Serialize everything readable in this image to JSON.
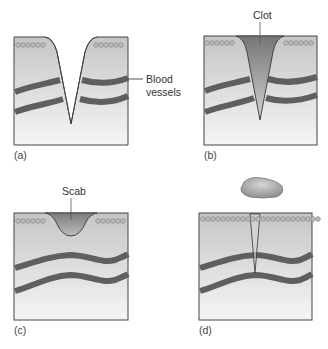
{
  "figure": {
    "panels": [
      {
        "id": "a",
        "label": "(a)",
        "annotation": "Blood vessels",
        "description": "V-shaped cut through skin and two blood vessels"
      },
      {
        "id": "b",
        "label": "(b)",
        "annotation": "Clot",
        "description": "Clot fills the wound"
      },
      {
        "id": "c",
        "label": "(c)",
        "annotation": "Scab",
        "description": "Scab forms at surface; vessels rejoined"
      },
      {
        "id": "d",
        "label": "(d)",
        "annotation": "",
        "description": "Scab falls off; skin surface healed with thin scar line"
      }
    ],
    "labels": {
      "blood_vessels_line1": "Blood",
      "blood_vessels_line2": "vessels",
      "clot": "Clot",
      "scab": "Scab"
    }
  },
  "colors": {
    "tissue_top": "#c9c9c9",
    "tissue_bottom": "#f4f4f4",
    "vessel": "#5f5f5f",
    "clot_top": "#7a7a7a",
    "clot_bottom": "#d0d0d0",
    "outline": "#444444",
    "cell": "#9a9a9a"
  }
}
